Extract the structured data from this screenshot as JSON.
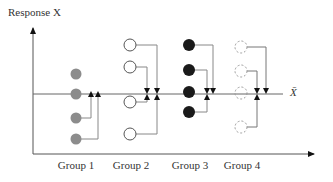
{
  "axes": {
    "y_label": "Response X",
    "mean_label": "X̄"
  },
  "groups": [
    {
      "label": "Group 1",
      "style": "gray-filled",
      "color": "#8c8c8c",
      "cx": 76,
      "points_y": [
        74,
        94,
        118,
        139
      ]
    },
    {
      "label": "Group 2",
      "style": "open",
      "color": "#555555",
      "cx": 130,
      "points_y": [
        45,
        67,
        102,
        134
      ]
    },
    {
      "label": "Group 3",
      "style": "black-filled",
      "color": "#1a1a1a",
      "cx": 189,
      "points_y": [
        45,
        70,
        92,
        112
      ]
    },
    {
      "label": "Group 4",
      "style": "dashed-open",
      "color": "#999999",
      "cx": 241,
      "points_y": [
        47,
        71,
        93,
        127
      ]
    }
  ],
  "colors": {
    "axis": "#555555",
    "connector": "#777777",
    "arrow": "#111111"
  }
}
